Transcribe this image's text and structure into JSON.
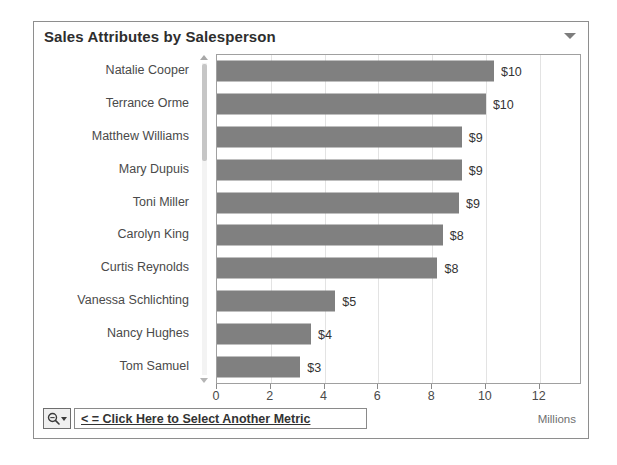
{
  "widget": {
    "title": "Sales Attributes by Salesperson",
    "menu_caret_icon": "chevron-down-icon"
  },
  "footer": {
    "metric_button_icon": "search-metric-icon",
    "metric_button_caret_icon": "caret-down-icon",
    "metric_select_label": "< = Click Here to Select Another Metric",
    "units_label": "Millions"
  },
  "scrollbar": {
    "up_arrow_icon": "scroll-up-arrow-icon",
    "down_arrow_icon": "scroll-down-arrow-icon"
  },
  "chart_data": {
    "type": "bar",
    "orientation": "horizontal",
    "title": "Sales Attributes by Salesperson",
    "xlabel": "",
    "ylabel": "",
    "units": "Millions",
    "xlim": [
      0,
      13.5
    ],
    "grid": true,
    "legend": false,
    "bar_color": "#808080",
    "categories": [
      "Natalie Cooper",
      "Terrance Orme",
      "Matthew Williams",
      "Mary Dupuis",
      "Toni Miller",
      "Carolyn King",
      "Curtis Reynolds",
      "Vanessa Schlichting",
      "Nancy Hughes",
      "Tom Samuel"
    ],
    "values": [
      10.3,
      10.0,
      9.1,
      9.1,
      9.0,
      8.4,
      8.2,
      4.4,
      3.5,
      3.1
    ],
    "value_labels": [
      "$10",
      "$10",
      "$9",
      "$9",
      "$9",
      "$8",
      "$8",
      "$5",
      "$4",
      "$3"
    ],
    "xticks": [
      0,
      2,
      4,
      6,
      8,
      10,
      12
    ],
    "xtick_labels": [
      "0",
      "2",
      "4",
      "6",
      "8",
      "10",
      "12"
    ]
  }
}
